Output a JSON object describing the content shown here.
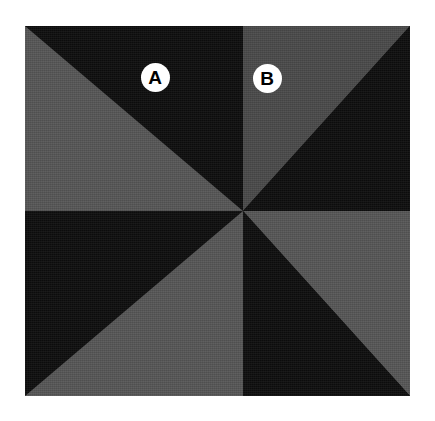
{
  "figure": {
    "title": "",
    "panel": {
      "x": 25,
      "y": 26,
      "width": 385,
      "height": 370,
      "background_color": "#0d0d0d"
    },
    "labels": [
      {
        "id": "A",
        "text": "A",
        "x": 155,
        "y": 77,
        "diameter": 29,
        "circle_color": "#ffffff",
        "text_color": "#000000",
        "sits_on_region": "dark"
      },
      {
        "id": "B",
        "text": "B",
        "x": 267,
        "y": 78,
        "diameter": 29,
        "circle_color": "#ffffff",
        "text_color": "#000000",
        "sits_on_region": "gray"
      }
    ]
  },
  "chart_data": {
    "type": "pie",
    "title": "",
    "subtitle": "",
    "xlabel": "",
    "ylabel": "",
    "center": {
      "x": 218,
      "y": 211
    },
    "colors": {
      "dark": "#0d0d0d",
      "gray_light": "#565656",
      "gray_dark": "#4a4a4a",
      "label_circle": "#ffffff",
      "label_text": "#000000",
      "background": "#ffffff"
    },
    "grid": false,
    "legend_position": "none",
    "categories": [
      "S1",
      "S2",
      "S3",
      "S4",
      "S5",
      "S6",
      "S7",
      "S8"
    ],
    "values": [
      12.5,
      12.5,
      12.5,
      12.5,
      12.5,
      12.5,
      12.5,
      12.5
    ],
    "series": [
      {
        "name": "sectors",
        "values": [
          12.5,
          12.5,
          12.5,
          12.5,
          12.5,
          12.5,
          12.5,
          12.5
        ]
      }
    ],
    "sectors": [
      {
        "name": "S1",
        "quadrant": "top-left",
        "half": "upper-right",
        "fill": "#0d0d0d",
        "tone": "dark",
        "points": "0,0 218,0 218,185"
      },
      {
        "name": "S2",
        "quadrant": "top-left",
        "half": "lower-left",
        "fill": "#565656",
        "tone": "gray",
        "points": "0,0 218,185 0,185"
      },
      {
        "name": "S3",
        "quadrant": "top-right",
        "half": "upper-left",
        "fill": "#4a4a4a",
        "tone": "gray",
        "points": "218,0 385,0 218,185"
      },
      {
        "name": "S4",
        "quadrant": "top-right",
        "half": "lower-right",
        "fill": "#0d0d0d",
        "tone": "dark",
        "points": "385,0 385,185 218,185"
      },
      {
        "name": "S5",
        "quadrant": "bottom-left",
        "half": "upper-left",
        "fill": "#0d0d0d",
        "tone": "dark",
        "points": "0,185 218,185 0,370"
      },
      {
        "name": "S6",
        "quadrant": "bottom-left",
        "half": "lower-right",
        "fill": "#565656",
        "tone": "gray",
        "points": "218,185 218,370 0,370"
      },
      {
        "name": "S7",
        "quadrant": "bottom-right",
        "half": "upper-right",
        "fill": "#565656",
        "tone": "gray",
        "points": "218,185 385,185 385,370"
      },
      {
        "name": "S8",
        "quadrant": "bottom-right",
        "half": "lower-left",
        "fill": "#0d0d0d",
        "tone": "dark",
        "points": "218,185 385,370 218,370"
      }
    ],
    "annotations": [
      {
        "label": "A",
        "x": 155,
        "y": 77,
        "on": "S1"
      },
      {
        "label": "B",
        "x": 267,
        "y": 78,
        "on": "S3"
      }
    ]
  }
}
